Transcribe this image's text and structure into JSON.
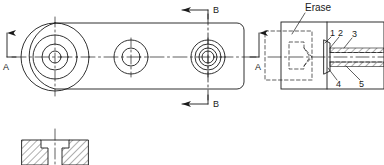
{
  "drawing": {
    "title": "mechanical-part-orthographic-drawing",
    "line_color": "#1a1a1a",
    "hatch_color": "#1a1a1a",
    "background": "#ffffff",
    "annotations": {
      "erase_note": "Erase",
      "section_a_left": "A",
      "section_a_right": "A",
      "section_b_top": "B",
      "section_b_bottom": "B",
      "callouts": [
        "1",
        "2",
        "3",
        "4",
        "5"
      ]
    },
    "views": {
      "plan": {
        "name": "plan-view",
        "body": {
          "x": 22,
          "y": 23,
          "width": 222,
          "height": 66,
          "corner_radius": 7
        },
        "centerline_y": 57,
        "bosses": [
          {
            "name": "left-boss",
            "cx": 55,
            "cy": 57,
            "radii": [
              34,
              22,
              13,
              6
            ]
          },
          {
            "name": "middle-hole",
            "cx": 131,
            "cy": 57,
            "radii": [
              17,
              9
            ]
          },
          {
            "name": "right-hole",
            "cx": 208,
            "cy": 57,
            "radii": [
              17,
              13,
              9,
              6
            ]
          }
        ]
      },
      "section_aa": {
        "name": "section-a-a-view",
        "outer": {
          "x": 281,
          "y": 22,
          "width": 103,
          "height": 67
        },
        "split_x": 327,
        "centerline_y": 57,
        "hidden_block": {
          "x": 265,
          "y": 31,
          "width": 47,
          "height": 49
        },
        "hidden_pocket": {
          "x": 289,
          "y": 42,
          "width": 23,
          "height": 27
        }
      },
      "section_bb": {
        "name": "section-b-b-view",
        "outer": {
          "x": 22,
          "y": 140,
          "width": 66,
          "height": 25
        },
        "centerline_x": 55,
        "counterbore": {
          "x": 41,
          "y": 140,
          "width": 28,
          "height": 8
        },
        "bore": {
          "x": 48,
          "y": 148,
          "width": 14,
          "height": 17
        }
      }
    }
  }
}
